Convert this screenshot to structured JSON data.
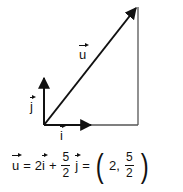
{
  "diagram": {
    "vectors": {
      "u": {
        "label": "u",
        "from": [
          44,
          125
        ],
        "to": [
          137,
          7
        ]
      },
      "i": {
        "label": "i",
        "from": [
          44,
          125
        ],
        "to": [
          90,
          125
        ]
      },
      "j": {
        "label": "j",
        "from": [
          44,
          125
        ],
        "to": [
          44,
          78
        ]
      }
    },
    "construction_lines": {
      "horizontal": {
        "from": [
          90,
          125
        ],
        "to": [
          138,
          125
        ]
      },
      "vertical": {
        "from": [
          138,
          125
        ],
        "to": [
          138,
          7
        ]
      }
    },
    "colors": {
      "stroke": "#111111",
      "construction": "#555555"
    }
  },
  "equation": {
    "lhs": "u",
    "eq1": "=",
    "coef_i": "2",
    "term_i": "i",
    "plus": "+",
    "frac1_num": "5",
    "frac1_den": "2",
    "term_j": "j",
    "eq2": "=",
    "open_paren": "(",
    "x": "2,",
    "frac2_num": "5",
    "frac2_den": "2",
    "close_paren": ")"
  }
}
